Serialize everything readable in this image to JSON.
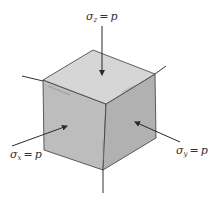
{
  "diagram": {
    "colors": {
      "top_face": "#d6d6d6",
      "left_face": "#bdbdbd",
      "right_face": "#b1b1b1",
      "edge": "#3a3a3a",
      "axis": "#333333",
      "arrow": "#2a2a2a",
      "background": "#ffffff"
    },
    "labels": {
      "sigma_z": {
        "symbol": "σ",
        "subscript": "z",
        "equals": "=",
        "value": "p"
      },
      "sigma_x": {
        "symbol": "σ",
        "subscript": "x",
        "equals": "=",
        "value": "p"
      },
      "sigma_y": {
        "symbol": "σ",
        "subscript": "y",
        "equals": "=",
        "value": "p"
      }
    },
    "arrows": [
      {
        "name": "sigma-z-arrow",
        "direction": "down",
        "target_face": "top"
      },
      {
        "name": "sigma-x-arrow",
        "direction": "into-left-face",
        "target_face": "left"
      },
      {
        "name": "sigma-y-arrow",
        "direction": "into-right-face",
        "target_face": "right"
      }
    ],
    "axes": [
      "x-axis",
      "y-axis",
      "z-axis"
    ]
  }
}
